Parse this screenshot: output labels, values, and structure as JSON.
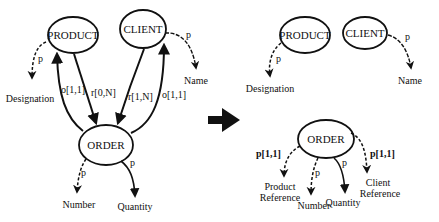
{
  "left_schema": {
    "nodes": {
      "product": "PRODUCT",
      "client": "CLIENT",
      "order": "ORDER"
    },
    "attributes": {
      "designation": "Designation",
      "name": "Name",
      "number": "Number",
      "quantity": "Quantity"
    },
    "edge_labels": {
      "product_designation": "p",
      "client_name": "p",
      "order_number": "p",
      "order_quantity": "p",
      "order_to_product": "o[1,1]",
      "product_to_order": "r[0,N]",
      "client_to_order": "r[1,N]",
      "order_to_client": "o[1,1]"
    }
  },
  "transform_arrow": "right-arrow",
  "right_schema": {
    "nodes": {
      "product": "PRODUCT",
      "client": "CLIENT",
      "order": "ORDER"
    },
    "attributes": {
      "designation": "Designation",
      "name": "Name",
      "product_reference_1": "Product",
      "product_reference_2": "Reference",
      "number": "Number",
      "quantity": "Quantity",
      "client_reference_1": "Client",
      "client_reference_2": "Reference"
    },
    "edge_labels": {
      "product_designation": "p",
      "client_name": "p",
      "order_product_ref": "p[1,1]",
      "order_number": "p",
      "order_quantity": "p",
      "order_client_ref": "p[1,1]"
    }
  },
  "colors": {
    "stroke": "#111111",
    "background": "#ffffff"
  }
}
